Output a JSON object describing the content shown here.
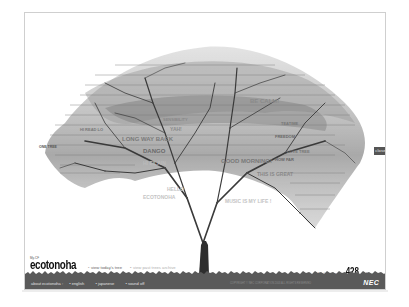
{
  "app": {
    "title": "ecotonoha",
    "logo_prefix": "My-CF",
    "brand": "NEC",
    "colors": {
      "frame_border": "#cfcfcf",
      "footer_bg": "#5a5a5a",
      "trunk": "#2e2e2e",
      "leaf_text": "#8a8a8a",
      "close_tab_bg": "#555555"
    }
  },
  "nav": {
    "view_today": "view today's tree",
    "view_past": "view past trees archive"
  },
  "entry": {
    "label": "today's entry:",
    "count": "428",
    "unit": "leaves"
  },
  "close_tab": {
    "label": "close"
  },
  "footer": {
    "about": "about ecotonoha :",
    "links": [
      "english",
      "japanese",
      "sound off"
    ],
    "copyright": "COPYRIGHT © NEC CORPORATION 2003 ALL RIGHTS RESERVED"
  },
  "tree": {
    "messages": [
      {
        "text": "BE CALM!",
        "x": 225,
        "y": 90,
        "size": 6
      },
      {
        "text": "LONG WAY BACK",
        "x": 100,
        "y": 128,
        "size": 6
      },
      {
        "text": "DANGO",
        "x": 120,
        "y": 140,
        "size": 6
      },
      {
        "text": "YAH!",
        "x": 145,
        "y": 118,
        "size": 5
      },
      {
        "text": "GOOD MORNING!",
        "x": 195,
        "y": 150,
        "size": 6
      },
      {
        "text": "THIS IS GREAT",
        "x": 230,
        "y": 162,
        "size": 5
      },
      {
        "text": "HI EILAIN",
        "x": 120,
        "y": 152,
        "size": 5
      },
      {
        "text": "HELLO",
        "x": 140,
        "y": 178,
        "size": 5
      },
      {
        "text": "ECOTONOHA",
        "x": 118,
        "y": 186,
        "size": 5
      },
      {
        "text": "MUSIC IS MY LIFE !",
        "x": 200,
        "y": 190,
        "size": 5
      },
      {
        "text": "ONE TREE",
        "x": 14,
        "y": 135,
        "size": 3.5
      },
      {
        "text": "HI READ LO",
        "x": 55,
        "y": 118,
        "size": 4
      },
      {
        "text": "SENSIBILITY",
        "x": 140,
        "y": 108,
        "size": 4
      },
      {
        "text": "FREEDOM",
        "x": 250,
        "y": 125,
        "size": 4
      },
      {
        "text": "HOW FAR",
        "x": 250,
        "y": 148,
        "size": 4
      },
      {
        "text": "LOVE TREE",
        "x": 262,
        "y": 140,
        "size": 4
      },
      {
        "text": "TEATIME",
        "x": 256,
        "y": 112,
        "size": 4
      }
    ]
  }
}
